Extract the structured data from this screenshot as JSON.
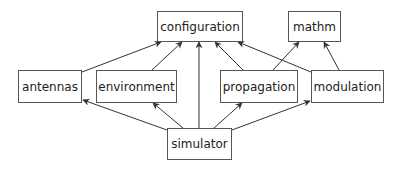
{
  "diagram": {
    "type": "dependency-graph",
    "colors": {
      "line": "#333333",
      "border": "#555555",
      "text": "#222222",
      "background": "#ffffff"
    },
    "nodes": {
      "configuration": {
        "label": "configuration",
        "x": 157,
        "y": 11,
        "w": 86,
        "h": 31
      },
      "mathm": {
        "label": "mathm",
        "x": 288,
        "y": 11,
        "w": 53,
        "h": 31
      },
      "antennas": {
        "label": "antennas",
        "x": 18,
        "y": 70,
        "w": 64,
        "h": 33
      },
      "environment": {
        "label": "environment",
        "x": 96,
        "y": 70,
        "w": 81,
        "h": 33
      },
      "propagation": {
        "label": "propagation",
        "x": 220,
        "y": 70,
        "w": 78,
        "h": 33
      },
      "modulation": {
        "label": "modulation",
        "x": 311,
        "y": 70,
        "w": 73,
        "h": 33
      },
      "simulator": {
        "label": "simulator",
        "x": 167,
        "y": 128,
        "w": 65,
        "h": 32
      }
    },
    "edges": [
      {
        "from": "antennas",
        "to": "configuration"
      },
      {
        "from": "environment",
        "to": "configuration"
      },
      {
        "from": "simulator",
        "to": "configuration"
      },
      {
        "from": "propagation",
        "to": "configuration"
      },
      {
        "from": "modulation",
        "to": "configuration"
      },
      {
        "from": "propagation",
        "to": "mathm"
      },
      {
        "from": "modulation",
        "to": "mathm"
      },
      {
        "from": "simulator",
        "to": "antennas"
      },
      {
        "from": "simulator",
        "to": "environment"
      },
      {
        "from": "simulator",
        "to": "propagation"
      },
      {
        "from": "simulator",
        "to": "modulation"
      }
    ]
  }
}
